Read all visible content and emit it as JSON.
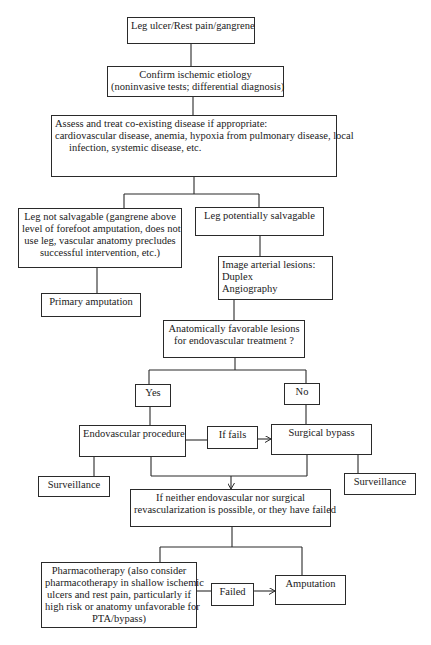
{
  "diagram": {
    "type": "flowchart",
    "nodes": {
      "start": {
        "lines": [
          "Leg ulcer/Rest pain/gangrene"
        ]
      },
      "confirm": {
        "lines": [
          "Confirm ischemic etiology",
          "(noninvasive tests; differential diagnosis)"
        ]
      },
      "assess": {
        "lines": [
          "Assess and treat co-existing disease if appropriate:",
          "cardiovascular disease, anemia, hypoxia from pulmonary disease, local",
          "infection, systemic disease, etc."
        ]
      },
      "not_salvagable": {
        "lines": [
          "Leg not salvagable (gangrene above",
          "level of forefoot amputation, does not",
          "use leg, vascular anatomy precludes",
          "successful intervention, etc.)"
        ]
      },
      "salvagable": {
        "lines": [
          "Leg potentially salvagable"
        ]
      },
      "primary_amputation": {
        "lines": [
          "Primary amputation"
        ]
      },
      "image_lesions": {
        "lines": [
          "Image arterial lesions:",
          "Duplex",
          "Angiography"
        ]
      },
      "favorable": {
        "lines": [
          "Anatomically favorable lesions",
          "for endovascular treatment ?"
        ]
      },
      "yes": {
        "lines": [
          "Yes"
        ]
      },
      "no": {
        "lines": [
          "No"
        ]
      },
      "endovascular": {
        "lines": [
          "Endovascular procedure"
        ]
      },
      "if_fails": {
        "lines": [
          "If fails"
        ]
      },
      "surgical_bypass": {
        "lines": [
          "Surgical bypass"
        ]
      },
      "surveillance_left": {
        "lines": [
          "Surveillance"
        ]
      },
      "surveillance_right": {
        "lines": [
          "Surveillance"
        ]
      },
      "if_neither": {
        "lines": [
          "If neither endovascular nor surgical",
          "revascularization is possible, or they have failed"
        ]
      },
      "pharmacotherapy": {
        "lines": [
          "Pharmacotherapy (also consider",
          "pharmacotherapy in shallow ischemic",
          "ulcers and rest pain, particularly if",
          "high risk or anatomy unfavorable for",
          "PTA/bypass)"
        ]
      },
      "failed": {
        "lines": [
          "Failed"
        ]
      },
      "amputation": {
        "lines": [
          "Amputation"
        ]
      }
    },
    "edges": [
      [
        "start",
        "confirm"
      ],
      [
        "confirm",
        "assess"
      ],
      [
        "assess",
        "not_salvagable"
      ],
      [
        "assess",
        "salvagable"
      ],
      [
        "not_salvagable",
        "primary_amputation"
      ],
      [
        "salvagable",
        "image_lesions"
      ],
      [
        "image_lesions",
        "favorable"
      ],
      [
        "favorable",
        "yes"
      ],
      [
        "favorable",
        "no"
      ],
      [
        "yes",
        "endovascular"
      ],
      [
        "no",
        "surgical_bypass"
      ],
      [
        "endovascular",
        "if_fails"
      ],
      [
        "if_fails",
        "surgical_bypass"
      ],
      [
        "endovascular",
        "surveillance_left"
      ],
      [
        "surgical_bypass",
        "surveillance_right"
      ],
      [
        "endovascular",
        "if_neither"
      ],
      [
        "surgical_bypass",
        "if_neither"
      ],
      [
        "if_neither",
        "pharmacotherapy"
      ],
      [
        "if_neither",
        "amputation"
      ],
      [
        "pharmacotherapy",
        "failed"
      ],
      [
        "failed",
        "amputation"
      ]
    ],
    "colors": {
      "line": "#2a2a2a",
      "text": "#1a1a1a",
      "background": "#ffffff"
    }
  }
}
